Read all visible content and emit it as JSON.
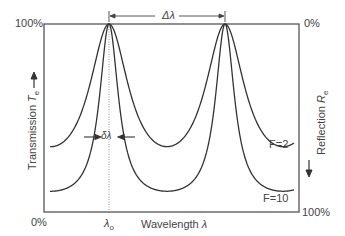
{
  "figure": {
    "left_axis": {
      "top_label": "100%",
      "bottom_label": "0%",
      "title": "Transmission",
      "symbol": "T",
      "subscript": "e"
    },
    "right_axis": {
      "top_label": "0%",
      "bottom_label": "100%",
      "title": "Reflection",
      "symbol": "R",
      "subscript": "e"
    },
    "x_axis": {
      "title": "Wavelength",
      "symbol": "λ",
      "center_label": "λ",
      "center_sub": "o"
    },
    "annotations": {
      "fsr": "Δλ",
      "fwhm": "δλ"
    },
    "curve_labels": {
      "low_finesse": "F=2",
      "high_finesse": "F=10"
    }
  },
  "chart_data": {
    "type": "line",
    "title": "",
    "xlabel": "Wavelength λ",
    "ylabel": "Transmission T_e (left) / Reflection R_e (right, inverted)",
    "ylim": [
      0,
      100
    ],
    "peaks_x_px": [
      109,
      225
    ],
    "series": [
      {
        "name": "F=2",
        "coefficient_of_finesse": 2,
        "peak": 100,
        "minimum": 33
      },
      {
        "name": "F=10",
        "coefficient_of_finesse": 10,
        "peak": 100,
        "minimum": 9
      }
    ],
    "grid": false,
    "legend": "inline labels"
  },
  "colors": {
    "line": "#333333",
    "frame": "#555555",
    "dotted": "#777777"
  }
}
